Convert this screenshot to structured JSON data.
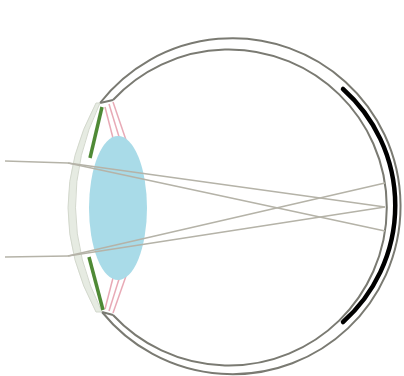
{
  "diagram": {
    "colors": {
      "background": "#ffffff",
      "sclera": "#7a7a72",
      "cornea_fill": "#e8ece4",
      "cornea_stroke": "#cfd4c8",
      "iris": "#4f8a36",
      "ciliary": "#e6a9b4",
      "lens": "#a9dbe8",
      "retina": "#000000",
      "ray": "#b5b3a8"
    },
    "parts": [
      {
        "name": "sclera",
        "label": "Sclera"
      },
      {
        "name": "cornea",
        "label": "Cornea"
      },
      {
        "name": "iris",
        "label": "Iris"
      },
      {
        "name": "ciliary-body",
        "label": "Ciliary body"
      },
      {
        "name": "lens",
        "label": "Lens"
      },
      {
        "name": "retina",
        "label": "Retina"
      },
      {
        "name": "light-rays",
        "label": "Light rays"
      }
    ]
  }
}
